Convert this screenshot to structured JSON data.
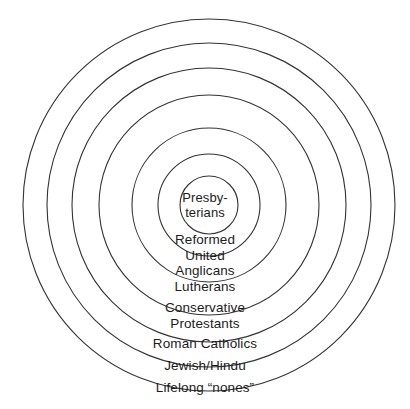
{
  "diagram": {
    "type": "concentric-rings",
    "title": "",
    "background_color": "#ffffff",
    "stroke_color": "#333333",
    "text_color": "#1c1c1c",
    "center": {
      "x": 209,
      "y": 205
    },
    "rings": [
      {
        "index": 0,
        "name": "presbyterians",
        "radius": 29,
        "label_lines": [
          "Presby-",
          "terians"
        ],
        "label_y": 190
      },
      {
        "index": 1,
        "name": "reformed-united",
        "radius": 51,
        "label_lines": [
          "Reformed",
          "United"
        ],
        "label_y": 232
      },
      {
        "index": 2,
        "name": "anglicans-lutherans",
        "radius": 77,
        "label_lines": [
          "Anglicans",
          "Lutherans"
        ],
        "label_y": 263
      },
      {
        "index": 3,
        "name": "conservative-protestants",
        "radius": 110,
        "label_lines": [
          "Conservative",
          "Protestants"
        ],
        "label_y": 300
      },
      {
        "index": 4,
        "name": "roman-catholics",
        "radius": 137,
        "label_lines": [
          "Roman Catholics"
        ],
        "label_y": 336
      },
      {
        "index": 5,
        "name": "jewish-hindu",
        "radius": 162,
        "label_lines": [
          "Jewish/Hindu"
        ],
        "label_y": 358
      },
      {
        "index": 6,
        "name": "lifelong-nones",
        "radius": 186,
        "label_lines": [
          "Lifelong “nones”"
        ],
        "label_y": 380
      }
    ]
  },
  "labels": {
    "ring0_line0": "Presby-",
    "ring0_line1": "terians",
    "ring1_line0": "Reformed",
    "ring1_line1": "United",
    "ring2_line0": "Anglicans",
    "ring2_line1": "Lutherans",
    "ring3_line0": "Conservative",
    "ring3_line1": "Protestants",
    "ring4_line0": "Roman Catholics",
    "ring5_line0": "Jewish/Hindu",
    "ring6_line0": "Lifelong “nones”"
  }
}
